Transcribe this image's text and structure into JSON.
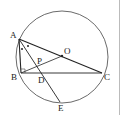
{
  "diagram": {
    "type": "geometry",
    "circle": {
      "cx": 62,
      "cy": 57,
      "r": 46
    },
    "points": {
      "A": {
        "x": 19,
        "y": 39,
        "label": "A"
      },
      "B": {
        "x": 21,
        "y": 73,
        "label": "B"
      },
      "C": {
        "x": 102,
        "y": 73,
        "label": "C"
      },
      "O": {
        "x": 62,
        "y": 56,
        "label": "O"
      },
      "P": {
        "x": 38,
        "y": 66,
        "label": "P"
      },
      "D": {
        "x": 44,
        "y": 73,
        "label": "D"
      },
      "E": {
        "x": 60,
        "y": 102,
        "label": "E"
      }
    },
    "segments": [
      "AB",
      "BC",
      "AC",
      "AE",
      "BO"
    ],
    "marks": [
      "right-angle-B",
      "equal-angle-dots-A"
    ],
    "labels": {
      "A": "A",
      "B": "B",
      "C": "C",
      "O": "O",
      "P": "P",
      "D": "D",
      "E": "E"
    }
  }
}
